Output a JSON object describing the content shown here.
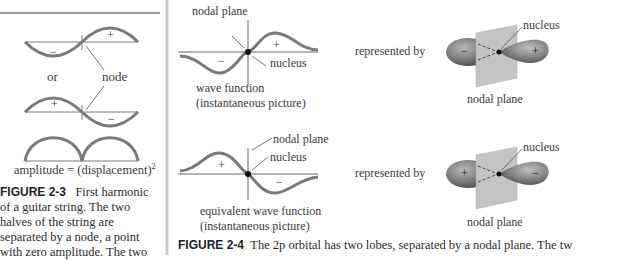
{
  "figure_2_3": {
    "or_label": "or",
    "node_label": "node",
    "plus": "+",
    "minus": "−",
    "amplitude_label": "amplitude = (displacement)",
    "amplitude_sup": "2",
    "caption_label": "FIGURE 2-3",
    "caption_lines": [
      "First harmonic",
      "of a guitar string. The two",
      "halves of the string are",
      "separated by a node, a point",
      "with zero amplitude. The two"
    ]
  },
  "figure_2_4": {
    "top": {
      "nodal_plane_label": "nodal plane",
      "nucleus_label": "nucleus",
      "wave_label_1": "wave function",
      "wave_label_2": "(instantaneous picture)",
      "represented_by": "represented by",
      "orbital_nucleus_label": "nucleus",
      "orbital_nodal_plane_label": "nodal plane",
      "left_sign": "−",
      "right_sign": "+"
    },
    "bottom": {
      "nodal_plane_label": "nodal plane",
      "nucleus_label": "nucleus",
      "wave_label_1": "equivalent wave function",
      "wave_label_2": "(instantaneous picture)",
      "represented_by": "represented by",
      "orbital_nucleus_label": "nucleus",
      "orbital_nodal_plane_label": "nodal plane",
      "left_sign": "+",
      "right_sign": "−"
    },
    "caption_label": "FIGURE 2-4",
    "caption_text": "The 2p orbital has two lobes, separated by a nodal plane. The tw"
  },
  "colors": {
    "wave": "#7a7a7a",
    "divider": "#c8c8c8",
    "plane": "#c4c4c4"
  }
}
